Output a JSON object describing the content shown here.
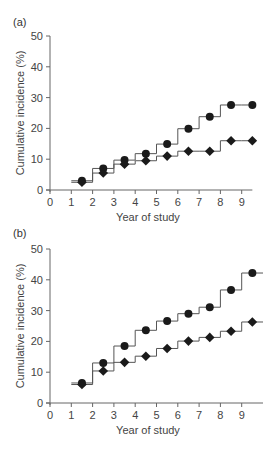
{
  "chart_data": [
    {
      "panel_label": "(a)",
      "type": "line",
      "step": true,
      "xlabel": "Year of study",
      "ylabel": "Cumulative incidence (%)",
      "xlim": [
        0,
        9.5
      ],
      "ylim": [
        0,
        50
      ],
      "xticks": [
        0,
        1,
        2,
        3,
        4,
        5,
        6,
        7,
        8,
        9
      ],
      "yticks": [
        0,
        10,
        20,
        30,
        40,
        50
      ],
      "grid": false,
      "x": [
        1.5,
        2.5,
        3.5,
        4.5,
        5.5,
        6.5,
        7.5,
        8.5,
        9.5
      ],
      "series": [
        {
          "name": "circle",
          "marker": "circle",
          "values": [
            3.0,
            7.0,
            9.7,
            11.8,
            14.9,
            19.9,
            23.8,
            27.6,
            27.6
          ]
        },
        {
          "name": "diamond",
          "marker": "diamond",
          "values": [
            2.5,
            5.5,
            8.4,
            9.5,
            11.0,
            12.6,
            12.6,
            16.0,
            16.0
          ]
        }
      ]
    },
    {
      "panel_label": "(b)",
      "type": "line",
      "step": true,
      "xlabel": "Year of study",
      "ylabel": "Cumulative incidence (%)",
      "xlim": [
        0,
        10
      ],
      "ylim": [
        0,
        50
      ],
      "xticks": [
        0,
        1,
        2,
        3,
        4,
        5,
        6,
        7,
        8,
        9
      ],
      "yticks": [
        0,
        10,
        20,
        30,
        40,
        50
      ],
      "grid": false,
      "x": [
        1.5,
        2.5,
        3.5,
        4.5,
        5.5,
        6.5,
        7.5,
        8.5,
        9.5
      ],
      "series": [
        {
          "name": "circle",
          "marker": "circle",
          "values": [
            6.5,
            13.0,
            18.5,
            23.6,
            26.6,
            29.0,
            31.1,
            36.7,
            42.2
          ]
        },
        {
          "name": "diamond",
          "marker": "diamond",
          "values": [
            6.0,
            10.4,
            13.2,
            15.2,
            17.7,
            20.1,
            21.3,
            23.3,
            26.3
          ]
        }
      ]
    }
  ],
  "colors": {
    "line": "#555555",
    "marker": "#1a1a1a",
    "axis": "#666666"
  }
}
